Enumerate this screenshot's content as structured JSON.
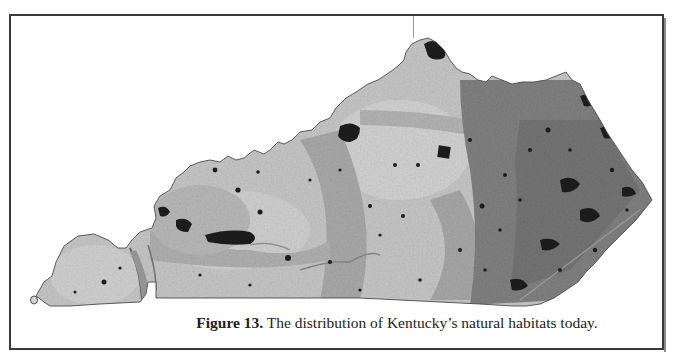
{
  "figure": {
    "label": "Figure 13.",
    "caption": " The distribution of Kentucky’s natural habitats today."
  },
  "map": {
    "subject": "Kentucky",
    "colors": {
      "light_region": "#c9c9c9",
      "mid_region": "#a4a4a4",
      "dark_region": "#7a7a7a",
      "habitat_patch": "#1e1e1e",
      "border": "#3a3a3a"
    }
  }
}
